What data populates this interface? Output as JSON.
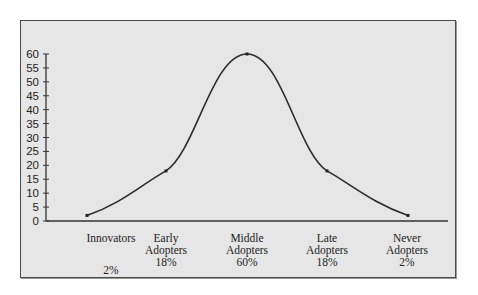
{
  "chart_data": {
    "type": "line",
    "title": "",
    "xlabel": "",
    "ylabel": "",
    "ylim": [
      0,
      60
    ],
    "yticks": [
      0,
      5,
      10,
      15,
      20,
      25,
      30,
      35,
      40,
      45,
      50,
      55,
      60
    ],
    "grid": false,
    "legend": null,
    "categories": [
      "Innovators",
      "Early Adopters",
      "Middle Adopters",
      "Late Adopters",
      "Never Adopters"
    ],
    "percent_labels": [
      "2%",
      "18%",
      "60%",
      "18%",
      "2%"
    ],
    "values": [
      2,
      18,
      60,
      18,
      2
    ],
    "curve": "smooth bell curve"
  },
  "labels": [
    {
      "line1": "Innovators",
      "line2": "",
      "pct": "2%"
    },
    {
      "line1": "Early",
      "line2": "Adopters",
      "pct": "18%"
    },
    {
      "line1": "Middle",
      "line2": "Adopters",
      "pct": "60%"
    },
    {
      "line1": "Late",
      "line2": "Adopters",
      "pct": "18%"
    },
    {
      "line1": "Never",
      "line2": "Adopters",
      "pct": "2%"
    }
  ],
  "colors": {
    "background": "#e6e6e6",
    "line": "#2a2a2a",
    "axis": "#333333"
  }
}
